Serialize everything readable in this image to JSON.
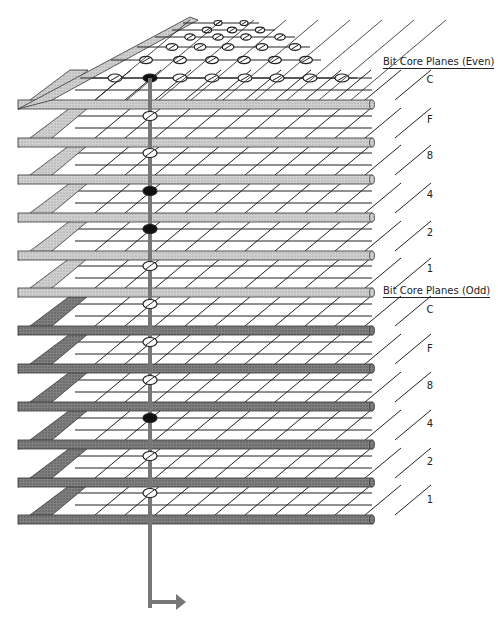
{
  "diagram": {
    "core_column_x": 150,
    "colors": {
      "light_frame": "#c8c8c8",
      "dark_frame": "#7a7a7a",
      "wire": "#333333",
      "sense_line": "#777777",
      "core_filled": "#111111"
    },
    "groups": [
      {
        "heading": "Bit Core Planes (Even)",
        "shade": "light",
        "planes": [
          {
            "label": "C",
            "core_state": "filled"
          },
          {
            "label": "F",
            "core_state": "open"
          },
          {
            "label": "8",
            "core_state": "open"
          },
          {
            "label": "4",
            "core_state": "filled"
          },
          {
            "label": "2",
            "core_state": "filled"
          },
          {
            "label": "1",
            "core_state": "open"
          }
        ]
      },
      {
        "heading": "Bit Core Planes (Odd)",
        "shade": "dark",
        "planes": [
          {
            "label": "C",
            "core_state": "open"
          },
          {
            "label": "F",
            "core_state": "open"
          },
          {
            "label": "8",
            "core_state": "open"
          },
          {
            "label": "4",
            "core_state": "filled"
          },
          {
            "label": "2",
            "core_state": "open"
          },
          {
            "label": "1",
            "core_state": "open"
          }
        ]
      }
    ],
    "output_arrow": "right-arrow"
  },
  "labels": {
    "even_heading": "Bit Core Planes (Even)",
    "odd_heading": "Bit Core Planes (Odd)",
    "even": [
      "C",
      "F",
      "8",
      "4",
      "2",
      "1"
    ],
    "odd": [
      "C",
      "F",
      "8",
      "4",
      "2",
      "1"
    ]
  }
}
